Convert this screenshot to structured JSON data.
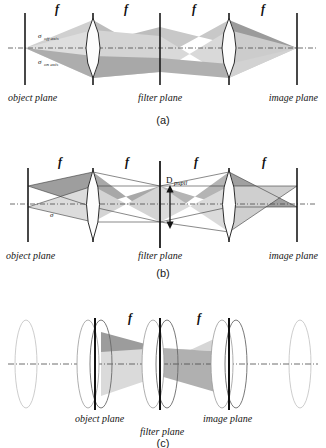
{
  "figure": {
    "background_color": "#ffffff",
    "panels": [
      {
        "id": "a",
        "caption": "(a)",
        "plane_labels": [
          "object plane",
          "filter plane",
          "image plane"
        ],
        "segment_labels": [
          "f",
          "f",
          "f",
          "f"
        ],
        "annotations": [
          {
            "symbol": "σ",
            "subscript": "off axis"
          },
          {
            "symbol": "σ",
            "subscript": "on axis"
          }
        ]
      },
      {
        "id": "b",
        "caption": "(b)",
        "plane_labels": [
          "object plane",
          "filter plane",
          "image plane"
        ],
        "segment_labels": [
          "f",
          "f",
          "f",
          "f"
        ],
        "annotations": [
          {
            "symbol": "D",
            "subscript": "pupil"
          },
          {
            "symbol": "σ",
            "subscript": ""
          }
        ]
      },
      {
        "id": "c",
        "caption": "(c)",
        "plane_labels": [
          "object plane",
          "filter plane",
          "image plane"
        ],
        "segment_labels": [
          "f",
          "f"
        ],
        "annotations": []
      }
    ],
    "colors": {
      "beam_light": "#d9d9d9",
      "beam_mid": "#c2c2c2",
      "beam_dark": "#a3a3a3",
      "plane_line": "#1a1a1a",
      "lens_fill": "#fdfdfd",
      "lens_stroke": "#2b2b2b",
      "lens_ghost_stroke": "#b9b9b9",
      "axis_line": "#4a4a4a",
      "text": "#141414"
    }
  }
}
